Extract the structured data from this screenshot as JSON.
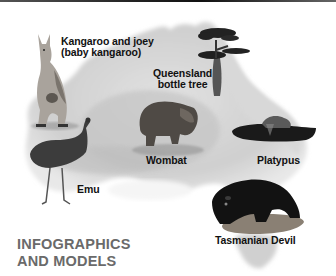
{
  "title": {
    "line1": "INFOGRAPHICS",
    "line2": "AND MODELS",
    "color": "#6a6a6a"
  },
  "map": {
    "subject": "Australia",
    "palette": "grayscale"
  },
  "labels": {
    "kangaroo_line1": "Kangaroo and joey",
    "kangaroo_line2": "(baby kangaroo)",
    "tree_line1": "Queensland",
    "tree_line2": "bottle tree",
    "wombat": "Wombat",
    "platypus": "Platypus",
    "emu": "Emu",
    "tasmanian_devil": "Tasmanian Devil"
  }
}
